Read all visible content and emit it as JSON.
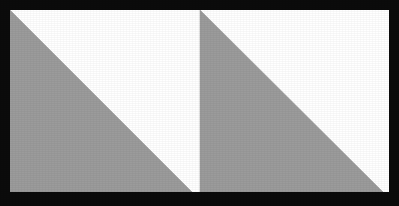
{
  "figure": {
    "caption": "Two identical shaded right triangles side by side within a bordered rectangle",
    "canvas": {
      "width": 399,
      "height": 206
    }
  },
  "colors": {
    "background": "#ffffff",
    "frame": "#0b0b0b",
    "frame_highlight": "#3a3a3a",
    "shape_fill": "#9b9b9b",
    "shape_stroke": "#9b9b9b",
    "interior": "#ffffff"
  },
  "frame": {
    "label": "outer-border",
    "thickness_px": 10,
    "outer": {
      "x": 0,
      "y": 0,
      "width": 399,
      "height": 206
    },
    "inner": {
      "x": 10,
      "y": 10,
      "width": 379,
      "height": 182
    }
  },
  "shapes": [
    {
      "id": "triangle-left",
      "label": "Left gray right triangle",
      "type": "right-triangle",
      "fill": "#9b9b9b",
      "right_angle_at": "bottom-left",
      "points": "10,10 10,192 192,192",
      "vertices": [
        {
          "name": "apex-top-left",
          "x": 10,
          "y": 10
        },
        {
          "name": "right-angle-bottom-left",
          "x": 10,
          "y": 192
        },
        {
          "name": "bottom-right",
          "x": 192,
          "y": 192
        }
      ],
      "leg_vertical_px": 182,
      "leg_horizontal_px": 182
    },
    {
      "id": "triangle-right",
      "label": "Right gray right triangle",
      "type": "right-triangle",
      "fill": "#9b9b9b",
      "right_angle_at": "bottom-left",
      "points": "200,10 200,192 383,192",
      "vertices": [
        {
          "name": "apex-top-left",
          "x": 200,
          "y": 10
        },
        {
          "name": "right-angle-bottom-left",
          "x": 200,
          "y": 192
        },
        {
          "name": "bottom-right",
          "x": 383,
          "y": 192
        }
      ],
      "leg_vertical_px": 182,
      "leg_horizontal_px": 183
    }
  ],
  "gaps": [
    {
      "id": "center-white-gap",
      "label": "White wedge between the two triangles",
      "x_start": 192,
      "x_end": 200,
      "fill": "#ffffff"
    }
  ]
}
